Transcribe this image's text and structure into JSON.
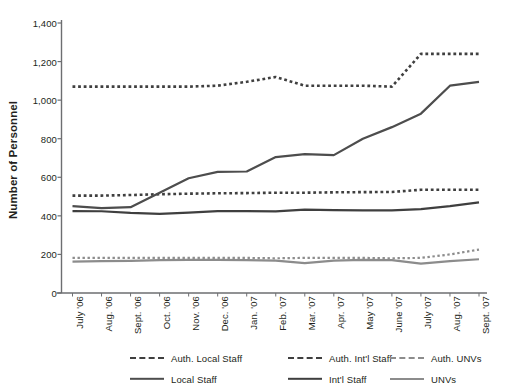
{
  "chart_data": {
    "type": "line",
    "title": "",
    "xlabel": "",
    "ylabel": "Number of Personnel",
    "ylim": [
      0,
      1400
    ],
    "ytick_step": 200,
    "yticks": [
      "0",
      "200",
      "400",
      "600",
      "800",
      "1,000",
      "1,200",
      "1,400"
    ],
    "grid": false,
    "legend_position": "bottom",
    "categories": [
      "July '06",
      "Aug. '06",
      "Sept. '06",
      "Oct. '06",
      "Nov. '06",
      "Dec. '06",
      "Jan. '07",
      "Feb. '07",
      "Mar. '07",
      "Apr. '07",
      "May '07",
      "June '07",
      "July '07",
      "Aug. '07",
      "Sept. '07"
    ],
    "series": [
      {
        "name": "Auth. Local Staff",
        "style": "dotted",
        "color": "#3f3f3f",
        "width": 2.6,
        "values": [
          1070,
          1070,
          1070,
          1070,
          1070,
          1075,
          1095,
          1120,
          1075,
          1075,
          1075,
          1070,
          1240,
          1240,
          1240
        ]
      },
      {
        "name": "Auth. Int'l Staff",
        "style": "dotted",
        "color": "#3f3f3f",
        "width": 2.6,
        "values": [
          505,
          505,
          508,
          512,
          515,
          517,
          518,
          520,
          520,
          522,
          523,
          524,
          535,
          535,
          535
        ]
      },
      {
        "name": "Auth. UNVs",
        "style": "dotted",
        "color": "#8c8c8c",
        "width": 2.2,
        "values": [
          182,
          182,
          182,
          182,
          182,
          182,
          182,
          180,
          182,
          182,
          182,
          180,
          182,
          200,
          225
        ]
      },
      {
        "name": "Local Staff",
        "style": "solid",
        "color": "#4d4d4d",
        "width": 2.2,
        "values": [
          450,
          440,
          445,
          520,
          595,
          628,
          630,
          705,
          720,
          715,
          800,
          860,
          930,
          1075,
          1095
        ]
      },
      {
        "name": "Int'l Staff",
        "style": "solid",
        "color": "#3f3f3f",
        "width": 2.2,
        "values": [
          425,
          424,
          415,
          410,
          417,
          425,
          425,
          423,
          432,
          430,
          428,
          428,
          435,
          450,
          470
        ]
      },
      {
        "name": "UNVs",
        "style": "solid",
        "color": "#8c8c8c",
        "width": 2.2,
        "values": [
          163,
          165,
          167,
          170,
          172,
          172,
          170,
          168,
          155,
          168,
          172,
          170,
          152,
          165,
          175
        ]
      }
    ]
  },
  "legend": {
    "rows": [
      [
        {
          "label": "Auth. Local Staff",
          "style": "dotted",
          "color": "#3f3f3f"
        },
        {
          "label": "Auth. Int'l  Staff",
          "style": "dotted",
          "color": "#3f3f3f"
        },
        {
          "label": "Auth. UNVs",
          "style": "dotted",
          "color": "#8c8c8c"
        }
      ],
      [
        {
          "label": "Local Staff",
          "style": "solid",
          "color": "#4d4d4d"
        },
        {
          "label": "Int'l Staff",
          "style": "solid",
          "color": "#3f3f3f"
        },
        {
          "label": "UNVs",
          "style": "solid",
          "color": "#8c8c8c"
        }
      ]
    ]
  },
  "axis": {
    "line_color": "#6d6e71"
  }
}
